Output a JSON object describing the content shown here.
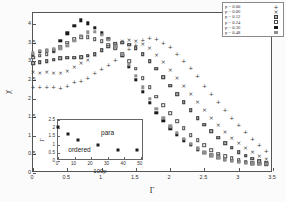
{
  "chart_data": {
    "type": "scatter",
    "title": "",
    "xlabel": "Γ",
    "ylabel": "χ",
    "xlim": [
      0,
      3.5
    ],
    "ylim": [
      0,
      4.3
    ],
    "xticks": [
      "0",
      "0.5",
      "1",
      "1.5",
      "2",
      "2.5",
      "3",
      "3.5"
    ],
    "xtick_values": [
      0,
      0.5,
      1,
      1.5,
      2,
      2.5,
      3,
      3.5
    ],
    "yticks": [
      "0",
      "0.5",
      "1",
      "1.5",
      "2",
      "2.5",
      "3",
      "3.5",
      "4"
    ],
    "ytick_values": [
      0,
      0.5,
      1,
      1.5,
      2,
      2.5,
      3,
      3.5,
      4
    ],
    "grid": false,
    "legend_position": "top-right",
    "series": [
      {
        "name": "p = 0.00",
        "marker": "plus",
        "x": [
          0.0,
          0.1,
          0.2,
          0.3,
          0.4,
          0.5,
          0.6,
          0.7,
          0.8,
          0.9,
          1.0,
          1.1,
          1.2,
          1.3,
          1.4,
          1.5,
          1.6,
          1.7,
          1.8,
          1.9,
          2.0,
          2.1,
          2.2,
          2.3,
          2.4,
          2.5,
          2.6,
          2.7,
          2.8,
          2.9,
          3.0,
          3.1,
          3.2,
          3.3,
          3.4
        ],
        "y": [
          2.3,
          2.3,
          2.32,
          2.3,
          2.28,
          2.35,
          2.45,
          2.48,
          2.55,
          2.7,
          2.8,
          2.9,
          3.05,
          3.2,
          3.32,
          3.45,
          3.58,
          3.62,
          3.6,
          3.5,
          3.38,
          3.2,
          3.02,
          2.82,
          2.6,
          2.35,
          2.12,
          1.9,
          1.68,
          1.48,
          1.28,
          1.1,
          0.92,
          0.75,
          0.6
        ]
      },
      {
        "name": "p = 0.06",
        "marker": "cross",
        "x": [
          0.0,
          0.1,
          0.2,
          0.3,
          0.4,
          0.5,
          0.6,
          0.7,
          0.8,
          0.9,
          1.0,
          1.1,
          1.2,
          1.3,
          1.4,
          1.5,
          1.6,
          1.7,
          1.8,
          1.9,
          2.0,
          2.1,
          2.2,
          2.3,
          2.4,
          2.5,
          2.6,
          2.7,
          2.8,
          2.9,
          3.0,
          3.1,
          3.2,
          3.3,
          3.4
        ],
        "y": [
          2.72,
          2.7,
          2.72,
          2.7,
          2.68,
          2.75,
          2.85,
          2.95,
          3.05,
          3.18,
          3.3,
          3.4,
          3.5,
          3.55,
          3.58,
          3.55,
          3.48,
          3.35,
          3.18,
          2.98,
          2.78,
          2.55,
          2.35,
          2.12,
          1.9,
          1.68,
          1.48,
          1.28,
          1.1,
          0.95,
          0.8,
          0.68,
          0.56,
          0.46,
          0.38
        ]
      },
      {
        "name": "p = 0.12",
        "marker": "square-half",
        "x": [
          0.0,
          0.1,
          0.2,
          0.3,
          0.4,
          0.5,
          0.6,
          0.7,
          0.8,
          0.9,
          1.0,
          1.1,
          1.2,
          1.3,
          1.4,
          1.5,
          1.6,
          1.7,
          1.8,
          1.9,
          2.0,
          2.1,
          2.2,
          2.3,
          2.4,
          2.5,
          2.6,
          2.7,
          2.8,
          2.9,
          3.0,
          3.1,
          3.2,
          3.3,
          3.4
        ],
        "y": [
          2.95,
          2.98,
          3.0,
          3.05,
          3.08,
          3.1,
          3.1,
          3.12,
          3.15,
          3.2,
          3.3,
          3.4,
          3.48,
          3.5,
          3.45,
          3.35,
          3.2,
          3.0,
          2.8,
          2.58,
          2.35,
          2.12,
          1.9,
          1.68,
          1.48,
          1.3,
          1.12,
          0.95,
          0.8,
          0.68,
          0.56,
          0.46,
          0.38,
          0.32,
          0.28
        ]
      },
      {
        "name": "p = 0.24",
        "marker": "square-open",
        "x": [
          0.0,
          0.1,
          0.2,
          0.3,
          0.4,
          0.5,
          0.6,
          0.7,
          0.8,
          0.9,
          1.0,
          1.1,
          1.2,
          1.3,
          1.4,
          1.5,
          1.6,
          1.7,
          1.8,
          1.9,
          2.0,
          2.1,
          2.2,
          2.3,
          2.4,
          2.5,
          2.6,
          2.7,
          2.8,
          2.9,
          3.0,
          3.1,
          3.2,
          3.3,
          3.4
        ],
        "y": [
          3.1,
          3.15,
          3.2,
          3.28,
          3.38,
          3.5,
          3.6,
          3.65,
          3.65,
          3.6,
          3.55,
          3.45,
          3.35,
          3.2,
          3.0,
          2.8,
          2.55,
          2.3,
          2.05,
          1.82,
          1.6,
          1.4,
          1.2,
          1.02,
          0.88,
          0.74,
          0.62,
          0.52,
          0.45,
          0.4,
          0.35,
          0.3,
          0.27,
          0.25,
          0.24
        ]
      },
      {
        "name": "p = 0.36",
        "marker": "square-filled",
        "x": [
          0.0,
          0.1,
          0.2,
          0.3,
          0.4,
          0.5,
          0.6,
          0.7,
          0.8,
          0.9,
          1.0,
          1.1,
          1.2,
          1.3,
          1.4,
          1.5,
          1.6,
          1.7,
          1.8,
          1.9,
          2.0,
          2.1,
          2.2,
          2.3,
          2.4,
          2.5,
          2.6,
          2.7,
          2.8,
          2.9,
          3.0,
          3.1,
          3.2,
          3.3,
          3.4
        ],
        "y": [
          3.18,
          3.25,
          3.28,
          3.3,
          3.55,
          3.75,
          3.95,
          4.1,
          4.02,
          3.9,
          3.75,
          3.6,
          3.4,
          3.15,
          2.85,
          2.5,
          2.18,
          1.88,
          1.62,
          1.4,
          1.2,
          1.02,
          0.88,
          0.75,
          0.64,
          0.55,
          0.48,
          0.42,
          0.37,
          0.33,
          0.3,
          0.28,
          0.26,
          0.25,
          0.24
        ]
      },
      {
        "name": "p = 0.48",
        "marker": "square-gray",
        "x": [
          0.0,
          0.1,
          0.2,
          0.3,
          0.4,
          0.5,
          0.6,
          0.7,
          0.8,
          0.9,
          1.0,
          1.1,
          1.2,
          1.3,
          1.4,
          1.5,
          1.6,
          1.7,
          1.8,
          1.9,
          2.0,
          2.1,
          2.2,
          2.3,
          2.4,
          2.5,
          2.6,
          2.7,
          2.8,
          2.9,
          3.0,
          3.1,
          3.2,
          3.3,
          3.4
        ],
        "y": [
          3.22,
          3.28,
          3.3,
          3.32,
          3.35,
          3.42,
          3.55,
          3.68,
          3.78,
          3.8,
          3.72,
          3.58,
          3.4,
          3.18,
          2.92,
          2.62,
          2.3,
          2.0,
          1.72,
          1.48,
          1.26,
          1.08,
          0.92,
          0.78,
          0.66,
          0.56,
          0.48,
          0.42,
          0.37,
          0.33,
          0.3,
          0.28,
          0.26,
          0.25,
          0.24
        ]
      }
    ],
    "inset": {
      "type": "scatter",
      "xlabel": "100p",
      "ylabel": "Γ",
      "xlim": [
        0,
        52
      ],
      "ylim": [
        0,
        2.5
      ],
      "xticks": [
        "0",
        "10",
        "20",
        "30",
        "40",
        "50"
      ],
      "xtick_values": [
        0,
        10,
        20,
        30,
        40,
        50
      ],
      "yticks": [
        "0",
        "0.5",
        "1",
        "1.5",
        "2",
        "2.5"
      ],
      "ytick_values": [
        0,
        0.5,
        1,
        1.5,
        2,
        2.5
      ],
      "x": [
        0,
        6,
        12,
        24,
        36,
        48
      ],
      "y": [
        2.1,
        1.65,
        1.3,
        0.95,
        0.7,
        0.65
      ],
      "annotations": [
        {
          "text": "para",
          "x": 30,
          "y": 1.75
        },
        {
          "text": "ordered",
          "x": 13,
          "y": 0.72
        }
      ]
    }
  },
  "legend": {
    "entries": [
      {
        "label": "p = 0.00",
        "symbol": "+"
      },
      {
        "label": "p = 0.06",
        "symbol": "×"
      },
      {
        "label": "p = 0.12",
        "symbol": "▣"
      },
      {
        "label": "p = 0.24",
        "symbol": "□"
      },
      {
        "label": "p = 0.36",
        "symbol": "■"
      },
      {
        "label": "p = 0.48",
        "symbol": "■"
      }
    ]
  }
}
